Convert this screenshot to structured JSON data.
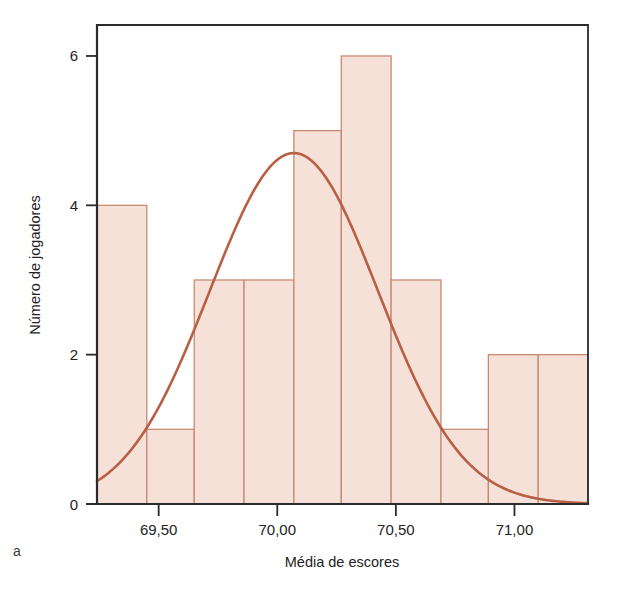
{
  "figure": {
    "panel_letter": "a",
    "background_color": "#ffffff"
  },
  "chart_data": {
    "type": "bar",
    "title": "",
    "subtitle": "",
    "xlabel": "Média de escores",
    "ylabel": "Número de jogadores",
    "xlim": [
      69.24,
      71.31
    ],
    "ylim": [
      0,
      6.4
    ],
    "grid": false,
    "legend": null,
    "x_tick_labels": [
      "69,50",
      "70,00",
      "70,50",
      "71,00"
    ],
    "x_tick_values": [
      69.5,
      70.0,
      70.5,
      71.0
    ],
    "y_tick_labels": [
      "0",
      "2",
      "4",
      "6"
    ],
    "y_tick_values": [
      0,
      2,
      4,
      6
    ],
    "bin_edges": [
      69.24,
      69.45,
      69.65,
      69.86,
      70.07,
      70.27,
      70.48,
      70.69,
      70.89,
      71.1,
      71.31
    ],
    "categories": [
      "69,24-69,45",
      "69,45-69,65",
      "69,65-69,86",
      "69,86-70,07",
      "70,07-70,27",
      "70,27-70,48",
      "70,48-70,69",
      "70,69-70,89",
      "70,89-71,10",
      "71,10-71,31"
    ],
    "values": [
      4,
      1,
      3,
      3,
      5,
      6,
      3,
      1,
      2,
      2
    ],
    "bar_fill_color": "#f5e1d8",
    "bar_edge_color": "#c88a74",
    "overlay": {
      "name": "normal-curve",
      "type": "line",
      "color": "#b85f45",
      "peak_x": 70.07,
      "peak_y": 4.7,
      "mean": 70.07,
      "sigma": 0.355,
      "amplitude": 4.7,
      "endpoint_left_y": 1.05,
      "endpoint_right_y": 0.62
    },
    "axis_color": "#2b2b2b",
    "total_count": 30
  }
}
